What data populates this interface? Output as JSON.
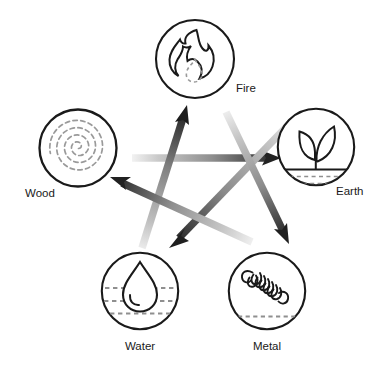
{
  "diagram": {
    "type": "pentagram-cycle",
    "background_color": "#ffffff",
    "stroke_color": "#1a1a1a",
    "dashed_color": "#8a8a8a",
    "arrow_dark": "#1f1f1f",
    "arrow_light": "#e2e2e2",
    "nodes": [
      {
        "id": "fire",
        "label": "Fire",
        "icon": "flame-icon",
        "cx": 195,
        "cy": 59,
        "r": 40,
        "label_x": 236,
        "label_y": 92
      },
      {
        "id": "earth",
        "label": "Earth",
        "icon": "sprout-in-soil-icon",
        "cx": 316,
        "cy": 147,
        "r": 39,
        "label_x": 336,
        "label_y": 195
      },
      {
        "id": "metal",
        "label": "Metal",
        "icon": "coil-spring-icon",
        "cx": 267,
        "cy": 291,
        "r": 39,
        "label_x": 267,
        "label_y": 350
      },
      {
        "id": "water",
        "label": "Water",
        "icon": "water-droplet-icon",
        "cx": 140,
        "cy": 291,
        "r": 39,
        "label_x": 140,
        "label_y": 350
      },
      {
        "id": "wood",
        "label": "Wood",
        "icon": "tree-rings-spiral-icon",
        "cx": 78,
        "cy": 148,
        "r": 40,
        "label_x": 40,
        "label_y": 197
      }
    ],
    "arrows": [
      {
        "id": "wood-to-earth",
        "from": "wood",
        "to": "earth",
        "x1": 132,
        "y1": 158,
        "x2": 278,
        "y2": 158
      },
      {
        "id": "earth-to-water",
        "from": "earth",
        "to": "water",
        "x1": 295,
        "y1": 118,
        "x2": 172,
        "y2": 245
      },
      {
        "id": "water-to-fire",
        "from": "water",
        "to": "fire",
        "x1": 142,
        "y1": 248,
        "x2": 186,
        "y2": 108
      },
      {
        "id": "fire-to-metal",
        "from": "fire",
        "to": "metal",
        "x1": 226,
        "y1": 112,
        "x2": 288,
        "y2": 240
      },
      {
        "id": "metal-to-wood",
        "from": "metal",
        "to": "wood",
        "x1": 252,
        "y1": 242,
        "x2": 112,
        "y2": 178
      }
    ]
  }
}
